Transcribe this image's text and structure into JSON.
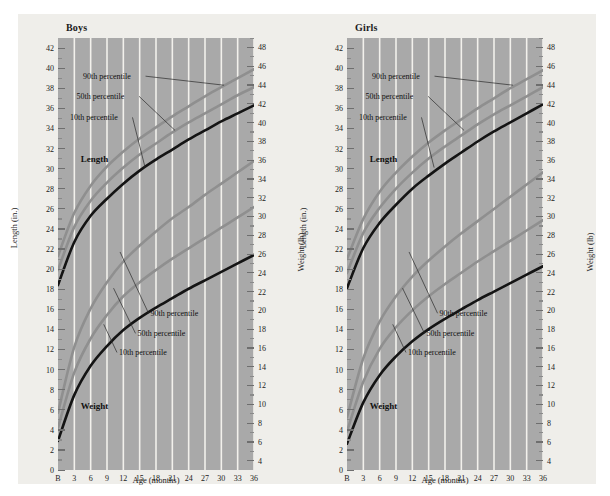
{
  "chart_data": [
    {
      "type": "line",
      "title": "Boys",
      "xlabel": "Age (months)",
      "ylabel_left": "Length (in.)",
      "ylabel_right": "Weight (lb)",
      "grid": true,
      "legend_position": "inline-annotations",
      "x": [
        0,
        3,
        6,
        9,
        12,
        15,
        18,
        21,
        24,
        27,
        30,
        33,
        36
      ],
      "xticklabels": [
        "B",
        "3",
        "6",
        "9",
        "12",
        "15",
        "18",
        "21",
        "24",
        "27",
        "30",
        "33",
        "36"
      ],
      "ylim_left": [
        0,
        43
      ],
      "ytick_left": [
        0,
        2,
        4,
        6,
        8,
        10,
        12,
        14,
        16,
        18,
        20,
        22,
        24,
        26,
        28,
        30,
        32,
        34,
        36,
        38,
        40,
        42
      ],
      "ylim_right": [
        3,
        49
      ],
      "ytick_right": [
        4,
        6,
        8,
        10,
        12,
        14,
        16,
        18,
        20,
        22,
        24,
        26,
        28,
        30,
        32,
        34,
        36,
        38,
        40,
        42,
        44,
        46,
        48
      ],
      "group_labels": [
        {
          "text": "Length",
          "x": 4.2,
          "y_left": 31.0
        },
        {
          "text": "Weight",
          "x": 4.2,
          "y_left": 6.4
        }
      ],
      "series": [
        {
          "name": "90th percentile",
          "measure": "Length (in.)",
          "axis": "left",
          "color": "#8f8f8f",
          "values": [
            21.3,
            25.6,
            28.3,
            30.2,
            31.7,
            33.0,
            34.1,
            35.2,
            36.2,
            37.2,
            38.1,
            39.0,
            39.9
          ]
        },
        {
          "name": "50th percentile",
          "measure": "Length (in.)",
          "axis": "left",
          "color": "#8f8f8f",
          "values": [
            19.9,
            24.2,
            26.8,
            28.6,
            30.1,
            31.4,
            32.5,
            33.6,
            34.6,
            35.5,
            36.4,
            37.3,
            38.1
          ]
        },
        {
          "name": "10th percentile",
          "measure": "Length (in.)",
          "axis": "left",
          "color": "#141414",
          "values": [
            18.4,
            22.7,
            25.3,
            27.0,
            28.5,
            29.8,
            30.9,
            31.9,
            32.9,
            33.8,
            34.7,
            35.5,
            36.3
          ]
        },
        {
          "name": "90th percentile",
          "measure": "Weight (lb)",
          "axis": "right",
          "color": "#8f8f8f",
          "values": [
            9.1,
            16.1,
            20.2,
            23.0,
            25.2,
            26.9,
            28.4,
            29.8,
            31.0,
            32.3,
            33.5,
            34.7,
            35.9
          ]
        },
        {
          "name": "50th percentile",
          "measure": "Weight (lb)",
          "axis": "right",
          "color": "#8f8f8f",
          "values": [
            7.5,
            13.4,
            17.0,
            19.5,
            21.5,
            23.0,
            24.3,
            25.5,
            26.6,
            27.7,
            28.8,
            29.9,
            31.0
          ]
        },
        {
          "name": "10th percentile",
          "measure": "Weight (lb)",
          "axis": "right",
          "color": "#141414",
          "values": [
            6.1,
            11.0,
            14.1,
            16.2,
            17.9,
            19.2,
            20.3,
            21.3,
            22.3,
            23.2,
            24.1,
            25.0,
            25.9
          ]
        }
      ],
      "annotations": [
        {
          "text": "90th percentile",
          "group": "length",
          "label_x": 4.6,
          "label_y_left": 39.2,
          "point_x": 30.5,
          "point_y_left": 38.3
        },
        {
          "text": "50th percentile",
          "group": "length",
          "label_x": 3.4,
          "label_y_left": 37.2,
          "point_x": 21.5,
          "point_y_left": 33.8
        },
        {
          "text": "10th percentile",
          "group": "length",
          "label_x": 2.2,
          "label_y_left": 35.1,
          "point_x": 16.0,
          "point_y_left": 30.1
        },
        {
          "text": "90th percentile",
          "group": "weight",
          "label_x": 17.0,
          "label_y_left": 15.6,
          "point_x": 11.4,
          "point_y_left": 21.7
        },
        {
          "text": "50th percentile",
          "group": "weight",
          "label_x": 14.6,
          "label_y_left": 13.6,
          "point_x": 10.2,
          "point_y_left": 18.1
        },
        {
          "text": "10th percentile",
          "group": "weight",
          "label_x": 11.2,
          "label_y_left": 11.7,
          "point_x": 8.4,
          "point_y_left": 14.5
        }
      ]
    },
    {
      "type": "line",
      "title": "Girls",
      "xlabel": "Age (months)",
      "ylabel_left": "Length (in.)",
      "ylabel_right": "Weight (lb)",
      "grid": true,
      "legend_position": "inline-annotations",
      "x": [
        0,
        3,
        6,
        9,
        12,
        15,
        18,
        21,
        24,
        27,
        30,
        33,
        36
      ],
      "xticklabels": [
        "B",
        "3",
        "6",
        "9",
        "12",
        "15",
        "18",
        "21",
        "24",
        "27",
        "30",
        "33",
        "36"
      ],
      "ylim_left": [
        0,
        43
      ],
      "ytick_left": [
        0,
        2,
        4,
        6,
        8,
        10,
        12,
        14,
        16,
        18,
        20,
        22,
        24,
        26,
        28,
        30,
        32,
        34,
        36,
        38,
        40,
        42
      ],
      "ylim_right": [
        3,
        49
      ],
      "ytick_right": [
        4,
        6,
        8,
        10,
        12,
        14,
        16,
        18,
        20,
        22,
        24,
        26,
        28,
        30,
        32,
        34,
        36,
        38,
        40,
        42,
        44,
        46,
        48
      ],
      "group_labels": [
        {
          "text": "Length",
          "x": 4.2,
          "y_left": 31.0
        },
        {
          "text": "Weight",
          "x": 4.2,
          "y_left": 6.4
        }
      ],
      "series": [
        {
          "name": "90th percentile",
          "measure": "Length (in.)",
          "axis": "left",
          "color": "#8f8f8f",
          "values": [
            21.0,
            25.0,
            27.7,
            29.6,
            31.2,
            32.6,
            33.8,
            34.9,
            36.0,
            37.0,
            38.0,
            38.9,
            39.8
          ]
        },
        {
          "name": "50th percentile",
          "measure": "Length (in.)",
          "axis": "left",
          "color": "#8f8f8f",
          "values": [
            19.6,
            23.6,
            26.1,
            28.0,
            29.6,
            31.0,
            32.2,
            33.3,
            34.4,
            35.4,
            36.3,
            37.2,
            38.1
          ]
        },
        {
          "name": "10th percentile",
          "measure": "Length (in.)",
          "axis": "left",
          "color": "#141414",
          "values": [
            18.1,
            22.1,
            24.6,
            26.4,
            28.0,
            29.3,
            30.5,
            31.6,
            32.7,
            33.7,
            34.6,
            35.5,
            36.4
          ]
        },
        {
          "name": "90th percentile",
          "measure": "Weight (lb)",
          "axis": "right",
          "color": "#8f8f8f",
          "values": [
            8.6,
            14.9,
            18.8,
            21.5,
            23.6,
            25.3,
            26.8,
            28.2,
            29.5,
            30.8,
            32.1,
            33.4,
            34.7
          ]
        },
        {
          "name": "50th percentile",
          "measure": "Weight (lb)",
          "axis": "right",
          "color": "#8f8f8f",
          "values": [
            7.1,
            12.4,
            15.9,
            18.2,
            20.0,
            21.5,
            22.8,
            24.0,
            25.2,
            26.3,
            27.4,
            28.5,
            29.6
          ]
        },
        {
          "name": "10th percentile",
          "measure": "Weight (lb)",
          "axis": "right",
          "color": "#141414",
          "values": [
            5.8,
            10.2,
            13.1,
            15.1,
            16.7,
            18.0,
            19.1,
            20.1,
            21.1,
            22.0,
            22.9,
            23.8,
            24.7
          ]
        }
      ],
      "annotations": [
        {
          "text": "90th percentile",
          "group": "length",
          "label_x": 4.6,
          "label_y_left": 39.2,
          "point_x": 30.5,
          "point_y_left": 38.3
        },
        {
          "text": "50th percentile",
          "group": "length",
          "label_x": 3.4,
          "label_y_left": 37.2,
          "point_x": 21.5,
          "point_y_left": 33.8
        },
        {
          "text": "10th percentile",
          "group": "length",
          "label_x": 2.2,
          "label_y_left": 35.1,
          "point_x": 16.0,
          "point_y_left": 30.1
        },
        {
          "text": "90th percentile",
          "group": "weight",
          "label_x": 17.0,
          "label_y_left": 15.6,
          "point_x": 11.4,
          "point_y_left": 21.7
        },
        {
          "text": "50th percentile",
          "group": "weight",
          "label_x": 14.6,
          "label_y_left": 13.6,
          "point_x": 10.2,
          "point_y_left": 18.1
        },
        {
          "text": "10th percentile",
          "group": "weight",
          "label_x": 11.2,
          "label_y_left": 11.7,
          "point_x": 8.4,
          "point_y_left": 14.5
        }
      ]
    }
  ],
  "colors": {
    "page_background": "#ffffff",
    "sheet_background": "#efeeea",
    "plot_background": "#a9a9a9",
    "gridline": "#f2f1ec",
    "curve_gray": "#8f8f8f",
    "curve_black": "#141414",
    "text": "#1b1b1b"
  }
}
